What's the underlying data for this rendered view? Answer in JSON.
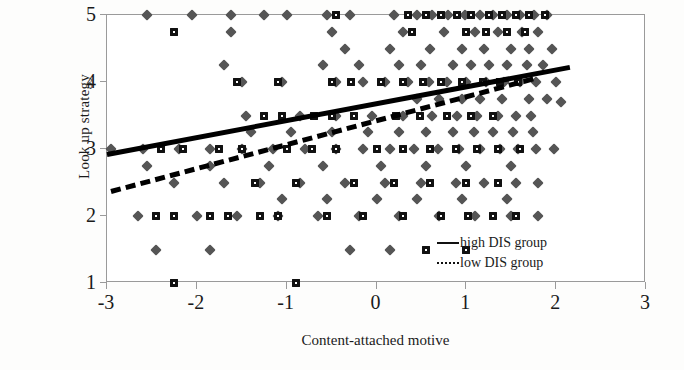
{
  "chart_data": {
    "type": "scatter",
    "title": "",
    "xlabel": "Content-attached motive",
    "ylabel": "Look up strategy",
    "xlim": [
      -3,
      3
    ],
    "ylim": [
      1,
      5
    ],
    "xticks": [
      "-3",
      "-2",
      "-1",
      "0",
      "1",
      "2",
      "3"
    ],
    "xtick_values": [
      -3,
      -2,
      -1,
      0,
      1,
      2,
      3
    ],
    "yticks": [
      "1",
      "2",
      "3",
      "4",
      "5"
    ],
    "ytick_values": [
      1,
      2,
      3,
      4,
      5
    ],
    "grid": false,
    "legend_position": "bottom-right",
    "legend": [
      {
        "label": "high DIS group",
        "style": "solid"
      },
      {
        "label": "low DIS group",
        "style": "dashed"
      }
    ],
    "series": [
      {
        "name": "high DIS group",
        "marker": "diamond",
        "color": "#555555",
        "points": [
          [
            -2.55,
            5.0
          ],
          [
            -2.05,
            5.0
          ],
          [
            -1.62,
            5.0
          ],
          [
            -1.25,
            5.0
          ],
          [
            -1.0,
            5.0
          ],
          [
            -0.55,
            5.0
          ],
          [
            -0.3,
            5.0
          ],
          [
            0.2,
            5.0
          ],
          [
            0.45,
            5.0
          ],
          [
            0.62,
            5.0
          ],
          [
            0.8,
            5.0
          ],
          [
            0.98,
            5.0
          ],
          [
            1.15,
            5.0
          ],
          [
            1.3,
            5.0
          ],
          [
            1.45,
            5.0
          ],
          [
            1.6,
            5.0
          ],
          [
            1.75,
            5.0
          ],
          [
            1.9,
            5.0
          ],
          [
            -1.62,
            4.75
          ],
          [
            -0.5,
            4.75
          ],
          [
            0.3,
            4.75
          ],
          [
            0.75,
            4.75
          ],
          [
            1.1,
            4.75
          ],
          [
            1.35,
            4.75
          ],
          [
            1.62,
            4.75
          ],
          [
            1.8,
            4.75
          ],
          [
            -0.35,
            4.5
          ],
          [
            0.15,
            4.5
          ],
          [
            0.6,
            4.5
          ],
          [
            0.95,
            4.5
          ],
          [
            1.2,
            4.5
          ],
          [
            1.5,
            4.5
          ],
          [
            1.7,
            4.5
          ],
          [
            1.95,
            4.5
          ],
          [
            -1.7,
            4.25
          ],
          [
            -0.6,
            4.25
          ],
          [
            -0.2,
            4.25
          ],
          [
            0.25,
            4.25
          ],
          [
            0.5,
            4.25
          ],
          [
            0.85,
            4.25
          ],
          [
            1.05,
            4.25
          ],
          [
            1.25,
            4.25
          ],
          [
            1.45,
            4.25
          ],
          [
            1.68,
            4.25
          ],
          [
            1.85,
            4.25
          ],
          [
            -1.5,
            4.0
          ],
          [
            -1.05,
            4.0
          ],
          [
            -0.45,
            4.0
          ],
          [
            -0.15,
            4.0
          ],
          [
            0.1,
            4.0
          ],
          [
            0.35,
            4.0
          ],
          [
            0.58,
            4.0
          ],
          [
            0.78,
            4.0
          ],
          [
            1.0,
            4.0
          ],
          [
            1.22,
            4.0
          ],
          [
            1.42,
            4.0
          ],
          [
            1.6,
            4.0
          ],
          [
            1.78,
            4.0
          ],
          [
            2.0,
            4.0
          ],
          [
            0.45,
            3.75
          ],
          [
            0.7,
            3.75
          ],
          [
            0.95,
            3.75
          ],
          [
            1.15,
            3.75
          ],
          [
            1.4,
            3.75
          ],
          [
            1.7,
            3.75
          ],
          [
            1.9,
            3.75
          ],
          [
            -1.45,
            3.5
          ],
          [
            -0.85,
            3.5
          ],
          [
            -0.45,
            3.5
          ],
          [
            -0.05,
            3.5
          ],
          [
            0.3,
            3.5
          ],
          [
            0.62,
            3.5
          ],
          [
            0.9,
            3.5
          ],
          [
            1.12,
            3.5
          ],
          [
            1.35,
            3.5
          ],
          [
            1.55,
            3.5
          ],
          [
            1.72,
            3.5
          ],
          [
            2.05,
            3.7
          ],
          [
            -2.95,
            3.0
          ],
          [
            -1.4,
            3.25
          ],
          [
            -0.95,
            3.25
          ],
          [
            -0.5,
            3.25
          ],
          [
            -0.1,
            3.25
          ],
          [
            0.25,
            3.25
          ],
          [
            0.55,
            3.25
          ],
          [
            0.85,
            3.25
          ],
          [
            1.08,
            3.25
          ],
          [
            1.3,
            3.25
          ],
          [
            1.52,
            3.25
          ],
          [
            1.74,
            3.25
          ],
          [
            -2.6,
            3.0
          ],
          [
            -2.2,
            3.0
          ],
          [
            -1.85,
            3.0
          ],
          [
            -1.5,
            3.0
          ],
          [
            -1.15,
            3.0
          ],
          [
            -0.8,
            3.0
          ],
          [
            -0.45,
            3.0
          ],
          [
            -0.15,
            3.0
          ],
          [
            0.15,
            3.0
          ],
          [
            0.42,
            3.0
          ],
          [
            0.68,
            3.0
          ],
          [
            0.92,
            3.0
          ],
          [
            1.15,
            3.0
          ],
          [
            1.38,
            3.0
          ],
          [
            1.58,
            3.0
          ],
          [
            1.78,
            3.0
          ],
          [
            1.98,
            3.0
          ],
          [
            -2.55,
            2.75
          ],
          [
            -1.85,
            2.75
          ],
          [
            -1.2,
            2.75
          ],
          [
            -0.6,
            2.75
          ],
          [
            0.05,
            2.75
          ],
          [
            0.55,
            2.75
          ],
          [
            1.0,
            2.75
          ],
          [
            1.5,
            2.75
          ],
          [
            -2.25,
            2.5
          ],
          [
            -1.7,
            2.5
          ],
          [
            -1.3,
            2.5
          ],
          [
            -0.85,
            2.5
          ],
          [
            -0.35,
            2.5
          ],
          [
            0.1,
            2.5
          ],
          [
            0.5,
            2.5
          ],
          [
            0.88,
            2.5
          ],
          [
            1.2,
            2.5
          ],
          [
            1.55,
            2.5
          ],
          [
            1.8,
            2.5
          ],
          [
            -1.05,
            2.25
          ],
          [
            -0.55,
            2.25
          ],
          [
            0.0,
            2.25
          ],
          [
            0.45,
            2.25
          ],
          [
            0.95,
            2.25
          ],
          [
            1.45,
            2.25
          ],
          [
            -2.65,
            2.0
          ],
          [
            -2.0,
            2.0
          ],
          [
            -1.55,
            2.0
          ],
          [
            -1.1,
            2.0
          ],
          [
            -0.65,
            2.0
          ],
          [
            -0.2,
            2.0
          ],
          [
            0.25,
            2.0
          ],
          [
            0.7,
            2.0
          ],
          [
            1.1,
            2.0
          ],
          [
            1.5,
            2.0
          ],
          [
            1.8,
            2.0
          ],
          [
            -2.45,
            1.5
          ],
          [
            -1.85,
            1.5
          ],
          [
            -0.3,
            1.5
          ],
          [
            0.15,
            1.5
          ]
        ]
      },
      {
        "name": "low DIS group",
        "marker": "square",
        "color": "#111111",
        "points": [
          [
            -0.45,
            5.0
          ],
          [
            0.35,
            5.0
          ],
          [
            0.55,
            5.0
          ],
          [
            0.72,
            5.0
          ],
          [
            0.9,
            5.0
          ],
          [
            1.05,
            5.0
          ],
          [
            1.25,
            5.0
          ],
          [
            1.4,
            5.0
          ],
          [
            1.55,
            5.0
          ],
          [
            1.7,
            5.0
          ],
          [
            1.88,
            5.0
          ],
          [
            -2.25,
            4.75
          ],
          [
            0.4,
            4.75
          ],
          [
            1.0,
            4.75
          ],
          [
            1.22,
            4.75
          ],
          [
            1.45,
            4.75
          ],
          [
            1.65,
            4.75
          ],
          [
            -1.55,
            4.0
          ],
          [
            -1.1,
            4.0
          ],
          [
            -0.5,
            4.0
          ],
          [
            -0.28,
            4.0
          ],
          [
            0.05,
            4.0
          ],
          [
            0.3,
            4.0
          ],
          [
            0.52,
            4.0
          ],
          [
            0.72,
            4.0
          ],
          [
            0.95,
            4.0
          ],
          [
            1.18,
            4.0
          ],
          [
            1.38,
            4.0
          ],
          [
            1.58,
            4.0
          ],
          [
            -1.25,
            3.5
          ],
          [
            -1.05,
            3.5
          ],
          [
            -0.7,
            3.5
          ],
          [
            -0.5,
            3.5
          ],
          [
            -0.25,
            3.5
          ],
          [
            0.22,
            3.5
          ],
          [
            0.48,
            3.5
          ],
          [
            0.78,
            3.5
          ],
          [
            1.05,
            3.5
          ],
          [
            1.3,
            3.5
          ],
          [
            -2.4,
            3.0
          ],
          [
            -2.15,
            3.0
          ],
          [
            -1.75,
            3.0
          ],
          [
            -1.5,
            3.0
          ],
          [
            -1.0,
            3.0
          ],
          [
            -0.72,
            3.0
          ],
          [
            -0.45,
            3.0
          ],
          [
            0.0,
            3.0
          ],
          [
            0.3,
            3.0
          ],
          [
            0.6,
            3.0
          ],
          [
            0.88,
            3.0
          ],
          [
            1.12,
            3.0
          ],
          [
            1.35,
            3.0
          ],
          [
            1.6,
            3.0
          ],
          [
            -1.35,
            2.5
          ],
          [
            -0.9,
            2.5
          ],
          [
            -0.25,
            2.5
          ],
          [
            0.2,
            2.5
          ],
          [
            0.6,
            2.5
          ],
          [
            1.0,
            2.5
          ],
          [
            1.35,
            2.5
          ],
          [
            -2.45,
            2.0
          ],
          [
            -2.25,
            2.0
          ],
          [
            -1.85,
            2.0
          ],
          [
            -1.65,
            2.0
          ],
          [
            -1.3,
            2.0
          ],
          [
            -1.1,
            2.0
          ],
          [
            -0.55,
            2.0
          ],
          [
            -0.15,
            2.0
          ],
          [
            0.3,
            2.0
          ],
          [
            0.72,
            2.0
          ],
          [
            1.02,
            2.0
          ],
          [
            1.3,
            2.0
          ],
          [
            1.55,
            2.0
          ],
          [
            0.55,
            1.5
          ],
          [
            1.0,
            1.5
          ],
          [
            -2.25,
            1.0
          ],
          [
            -0.9,
            1.0
          ]
        ]
      }
    ],
    "trendlines": [
      {
        "name": "high DIS group",
        "style": "solid",
        "x0": -3.0,
        "y0": 2.95,
        "x1": 2.15,
        "y1": 4.25
      },
      {
        "name": "low DIS group",
        "style": "dashed",
        "x0": -2.95,
        "y0": 2.4,
        "x1": 1.75,
        "y1": 4.08
      }
    ]
  }
}
